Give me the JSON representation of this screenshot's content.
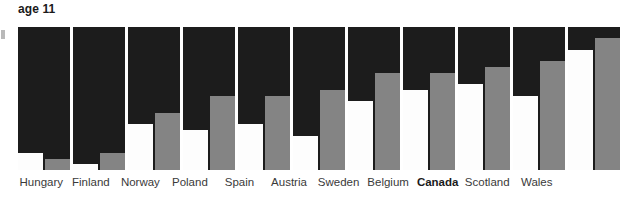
{
  "chart_data": {
    "type": "bar",
    "title": "age 11",
    "xlabel": "",
    "ylabel": "",
    "ylim": [
      0,
      25
    ],
    "grid": false,
    "legend_position": "none",
    "categories": [
      "Hungary",
      "Finland",
      "Norway",
      "Poland",
      "Spain",
      "Austria",
      "Sweden",
      "Belgium",
      "Canada",
      "Scotland",
      "Wales"
    ],
    "highlight_category": "Canada",
    "series": [
      {
        "name": "white",
        "color": "#fdfdfd",
        "values": [
          3,
          1,
          8,
          7,
          8,
          6,
          12,
          14,
          15,
          13,
          21
        ]
      },
      {
        "name": "grey",
        "color": "#848484",
        "values": [
          2,
          3,
          10,
          13,
          13,
          14,
          17,
          17,
          18,
          19,
          23
        ]
      }
    ],
    "panel_background": "#1c1c1c",
    "value_label_color": "#ffffff"
  },
  "chart": {
    "title": "age 11"
  }
}
